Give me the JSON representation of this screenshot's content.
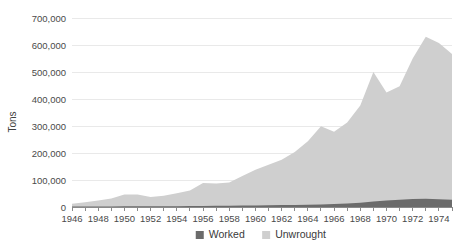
{
  "chart_data": {
    "type": "area",
    "stacked": true,
    "title": "",
    "subtitle": "",
    "xlabel": "",
    "ylabel": "Tons",
    "grid": true,
    "legend_position": "bottom",
    "xlim": [
      1946,
      1975
    ],
    "ylim": [
      0,
      700000
    ],
    "x": [
      1946,
      1947,
      1948,
      1949,
      1950,
      1951,
      1952,
      1953,
      1954,
      1955,
      1956,
      1957,
      1958,
      1959,
      1960,
      1961,
      1962,
      1963,
      1964,
      1965,
      1966,
      1967,
      1968,
      1969,
      1970,
      1971,
      1972,
      1973,
      1974,
      1975
    ],
    "xtick_labels": [
      "1946",
      "1948",
      "1950",
      "1952",
      "1954",
      "1956",
      "1958",
      "1960",
      "1962",
      "1964",
      "1966",
      "1968",
      "1970",
      "1972",
      "1974"
    ],
    "ytick_labels": [
      "0",
      "100,000",
      "200,000",
      "300,000",
      "400,000",
      "500,000",
      "600,000",
      "700,000"
    ],
    "ytick_values": [
      0,
      100000,
      200000,
      300000,
      400000,
      500000,
      600000,
      700000
    ],
    "series": [
      {
        "name": "Worked",
        "color": "#6b6b6b",
        "values": [
          1500,
          1800,
          2000,
          2200,
          2500,
          2600,
          2400,
          2600,
          3000,
          3500,
          4000,
          4200,
          4500,
          5200,
          6000,
          6500,
          7000,
          7800,
          8500,
          9500,
          11000,
          13000,
          16000,
          20000,
          24000,
          27000,
          30000,
          31000,
          29000,
          27000
        ]
      },
      {
        "name": "Unwrought",
        "color": "#cfcfcf",
        "values": [
          11000,
          16000,
          22000,
          29000,
          44000,
          44000,
          35000,
          39000,
          48000,
          58000,
          85000,
          83000,
          86000,
          110000,
          132000,
          150000,
          168000,
          196000,
          235000,
          290000,
          268000,
          300000,
          360000,
          480000,
          400000,
          420000,
          520000,
          600000,
          578000,
          540000
        ]
      }
    ]
  },
  "legend": {
    "items": [
      {
        "label": "Worked",
        "color": "#6b6b6b"
      },
      {
        "label": "Unwrought",
        "color": "#cfcfcf"
      }
    ]
  },
  "axes": {
    "y_title": "Tons"
  }
}
